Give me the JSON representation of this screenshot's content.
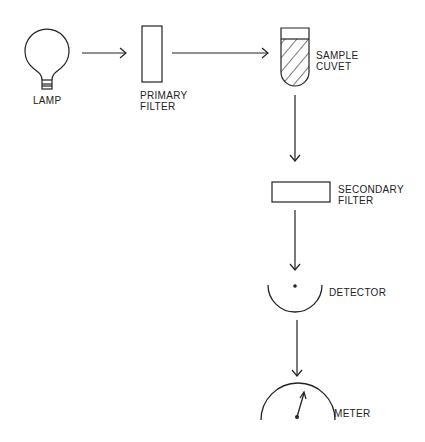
{
  "diagram": {
    "type": "spectrophotometer-flow",
    "stroke_color": "#222222",
    "background": "#ffffff",
    "components": {
      "lamp": {
        "label": "LAMP"
      },
      "primary_filter": {
        "label_line1": "PRIMARY",
        "label_line2": "FILTER"
      },
      "sample_cuvet": {
        "label_line1": "SAMPLE",
        "label_line2": "CUVET"
      },
      "secondary_filter": {
        "label_line1": "SECONDARY",
        "label_line2": "FILTER"
      },
      "detector": {
        "label": "DETECTOR"
      },
      "meter": {
        "label": "METER"
      }
    },
    "flow": [
      "LAMP",
      "PRIMARY FILTER",
      "SAMPLE CUVET",
      "SECONDARY FILTER",
      "DETECTOR",
      "METER"
    ]
  }
}
